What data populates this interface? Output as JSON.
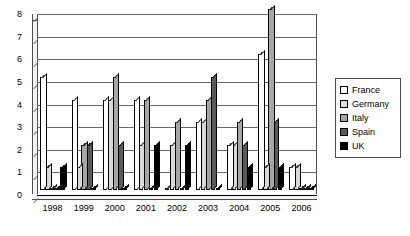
{
  "chart_data": {
    "type": "bar",
    "title": "",
    "subtitle": "",
    "xlabel": "",
    "ylabel": "",
    "categories": [
      "1998",
      "1999",
      "2000",
      "2001",
      "2002",
      "2003",
      "2004",
      "2005",
      "2006"
    ],
    "series": [
      {
        "name": "France",
        "color": "#ffffff",
        "values": [
          5,
          4,
          4,
          4,
          0,
          3,
          2,
          6,
          1
        ]
      },
      {
        "name": "Germany",
        "color": "#d9d9d9",
        "values": [
          1,
          1,
          4,
          2,
          2,
          3,
          2,
          1,
          1
        ]
      },
      {
        "name": "Italy",
        "color": "#a6a6a6",
        "values": [
          0,
          2,
          5,
          4,
          3,
          4,
          3,
          8,
          0
        ]
      },
      {
        "name": "Spain",
        "color": "#595959",
        "values": [
          0,
          2,
          2,
          0,
          0,
          5,
          2,
          3,
          0
        ]
      },
      {
        "name": "UK",
        "color": "#000000",
        "values": [
          1,
          0,
          0,
          2,
          2,
          0,
          1,
          1,
          0
        ]
      }
    ],
    "ylim": [
      0,
      8
    ],
    "ytick_step": 1,
    "yticks": [
      "0",
      "1",
      "2",
      "3",
      "4",
      "5",
      "6",
      "7",
      "8"
    ],
    "grid": true,
    "legend_position": "right",
    "style": "3d-clustered-column"
  },
  "legend": {
    "items": [
      {
        "label": "France"
      },
      {
        "label": "Germany"
      },
      {
        "label": "Italy"
      },
      {
        "label": "Spain"
      },
      {
        "label": "UK"
      }
    ]
  }
}
